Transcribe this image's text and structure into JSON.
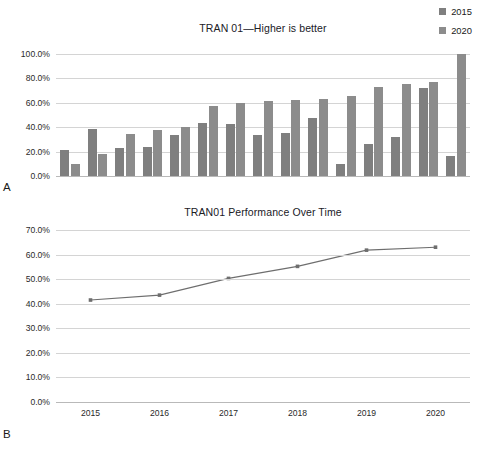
{
  "figure": {
    "panel_a_letter": "A",
    "panel_b_letter": "B"
  },
  "panel_a": {
    "title": "TRAN 01—Higher is better",
    "legend": [
      {
        "label": "2015",
        "color": "#7f7f7f"
      },
      {
        "label": "2020",
        "color": "#8c8c8c"
      }
    ],
    "chart_data": {
      "type": "bar",
      "title": "TRAN 01—Higher is better",
      "xlabel": "",
      "ylabel": "",
      "ylim": [
        0,
        100
      ],
      "ytick_labels": [
        "0.0%",
        "20.0%",
        "40.0%",
        "60.0%",
        "80.0%",
        "100.0%"
      ],
      "ytick_values": [
        0,
        20,
        40,
        60,
        80,
        100
      ],
      "grid": true,
      "legend_position": "top-right",
      "categories": [
        "1",
        "2",
        "3",
        "4",
        "5",
        "6",
        "7",
        "8",
        "9",
        "10",
        "11",
        "12",
        "13"
      ],
      "series": [
        {
          "name": "2015",
          "color": "#7f7f7f",
          "values": [
            21.0,
            38.5,
            23.3,
            24.0,
            33.8,
            43.8,
            43.0,
            33.6,
            35.2,
            47.5,
            9.8,
            26.2,
            31.6,
            72.5,
            16.0
          ]
        },
        {
          "name": "2020",
          "color": "#8c8c8c",
          "values": [
            10.2,
            18.0,
            34.7,
            38.0,
            40.5,
            57.4,
            60.2,
            61.7,
            62.2,
            63.3,
            65.4,
            72.6,
            75.3,
            77.0,
            100.0
          ]
        }
      ],
      "pairs": [
        {
          "a": 21.0,
          "b": 10.2
        },
        {
          "a": 38.5,
          "b": 18.0
        },
        {
          "a": 23.3,
          "b": 34.7
        },
        {
          "a": 24.0,
          "b": 38.0
        },
        {
          "a": 33.8,
          "b": 40.5
        },
        {
          "a": 43.8,
          "b": 57.4
        },
        {
          "a": 43.0,
          "b": 60.2
        },
        {
          "a": 33.6,
          "b": 61.7
        },
        {
          "a": 35.2,
          "b": 62.2
        },
        {
          "a": 47.5,
          "b": 63.3
        },
        {
          "a": 9.8,
          "b": 65.4
        },
        {
          "a": 26.2,
          "b": 72.6
        },
        {
          "a": 31.6,
          "b": 75.3
        },
        {
          "a": 72.5,
          "b": 77.0
        },
        {
          "a": 16.0,
          "b": 100.0
        }
      ]
    }
  },
  "panel_b": {
    "title": "TRAN01 Performance Over Time",
    "chart_data": {
      "type": "line",
      "title": "TRAN01 Performance Over Time",
      "xlabel": "",
      "ylabel": "",
      "ylim": [
        0,
        70
      ],
      "xlim": [
        "2015",
        "2020"
      ],
      "ytick_labels": [
        "0.0%",
        "10.0%",
        "20.0%",
        "30.0%",
        "40.0%",
        "50.0%",
        "60.0%",
        "70.0%"
      ],
      "ytick_values": [
        0,
        10,
        20,
        30,
        40,
        50,
        60,
        70
      ],
      "xtick_labels": [
        "2015",
        "2016",
        "2017",
        "2018",
        "2019",
        "2020"
      ],
      "grid": true,
      "legend_position": "none",
      "line_color": "#6e6e6e",
      "marker_color": "#6e6e6e",
      "x": [
        "2015",
        "2016",
        "2017",
        "2018",
        "2019",
        "2020"
      ],
      "values": [
        41.5,
        43.5,
        50.3,
        55.2,
        61.8,
        63.0
      ],
      "series": [
        {
          "name": "TRAN01",
          "values": [
            41.5,
            43.5,
            50.3,
            55.2,
            61.8,
            63.0
          ]
        }
      ]
    }
  }
}
